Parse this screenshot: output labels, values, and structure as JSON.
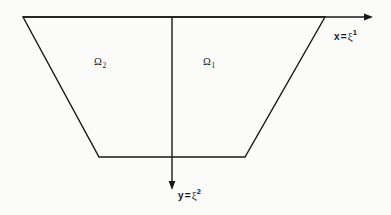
{
  "figure": {
    "background_color": "#fbfbfa",
    "stroke_color": "#18181a",
    "stroke_width": 1.4,
    "width": 391,
    "height": 215,
    "caption": "Trapezoidal domain divided into two subregions by a vertical axis"
  },
  "regions": [
    {
      "id": "omega-2",
      "symbol": "Ω",
      "subscript": "2",
      "full_label": "Ω₂",
      "position": {
        "x": 94,
        "y": 57
      },
      "side": "left"
    },
    {
      "id": "omega-1",
      "symbol": "Ω",
      "subscript": "1",
      "full_label": "Ω₁",
      "position": {
        "x": 203,
        "y": 57
      },
      "side": "right"
    }
  ],
  "axes": [
    {
      "id": "x-axis",
      "variable": "x",
      "equals": "=",
      "coordinate_symbol": "ξ",
      "superscript": "1",
      "full_label": "x = ξ¹",
      "direction": "horizontal-right",
      "line": {
        "x1": 23,
        "y1": 17,
        "x2": 373,
        "y2": 17
      },
      "arrow_tip": {
        "x": 373,
        "y": 17
      },
      "label_position": {
        "x": 334,
        "y": 31
      }
    },
    {
      "id": "y-axis",
      "variable": "y",
      "equals": "=",
      "coordinate_symbol": "ξ",
      "superscript": "2",
      "full_label": "y = ξ²",
      "direction": "vertical-down",
      "line": {
        "x1": 172,
        "y1": 17,
        "x2": 172,
        "y2": 190
      },
      "arrow_tip": {
        "x": 172,
        "y": 190
      },
      "label_position": {
        "x": 178,
        "y": 190
      }
    }
  ],
  "shape": {
    "id": "trapezoid",
    "type": "polygon",
    "vertices": [
      {
        "name": "top-left",
        "x": 23,
        "y": 17
      },
      {
        "name": "top-right",
        "x": 325,
        "y": 17
      },
      {
        "name": "bottom-right",
        "x": 245,
        "y": 157
      },
      {
        "name": "bottom-left",
        "x": 99,
        "y": 157
      }
    ],
    "points_attr": "23,17 325,17 245,157 99,157"
  },
  "divider": {
    "id": "region-divider",
    "description": "vertical line separating Ω₂ from Ω₁",
    "x1": 172,
    "y1": 17,
    "x2": 172,
    "y2": 157
  }
}
